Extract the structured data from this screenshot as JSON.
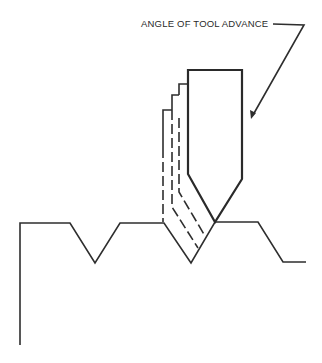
{
  "diagram": {
    "title": "",
    "callout": {
      "label": "ANGLE OF TOOL ADVANCE",
      "arrow": "points to right flank of cutting tool"
    },
    "elements": {
      "workpiece": "threaded workpiece profile with V-shaped thread grooves",
      "tool": "single-point threading tool with 60-degree pointed tip",
      "previous_positions": "3 dashed outlines showing prior tool positions stepping down along the angle of advance"
    },
    "colors": {
      "line": "#2e2e2e",
      "background": "#ffffff"
    }
  }
}
